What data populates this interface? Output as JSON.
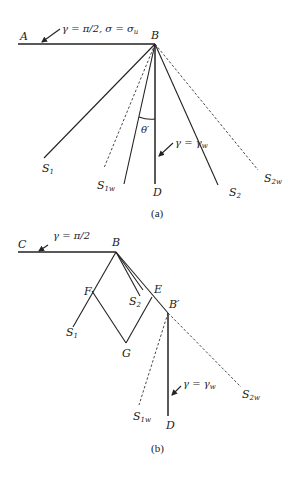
{
  "figure_a": {
    "caption": "(a)",
    "point_A": "A",
    "point_B": "B",
    "point_D": "D",
    "label_S1": "S",
    "label_S1_sub": "1",
    "label_S1w": "S",
    "label_S1w_sub": "1w",
    "label_S2": "S",
    "label_S2_sub": "2",
    "label_S2w": "S",
    "label_S2w_sub": "2w",
    "boundary_condition_top": "γ = π/2, σ = σ",
    "boundary_condition_top_sub": "u",
    "angle_label": "θ′",
    "wall_condition": "γ = γ",
    "wall_condition_sub": "w"
  },
  "figure_b": {
    "caption": "(b)",
    "point_C": "C",
    "point_B": "B",
    "point_F": "F",
    "point_E": "E",
    "point_G": "G",
    "point_Bprime": "B′",
    "point_D": "D",
    "label_S1": "S",
    "label_S1_sub": "1",
    "label_S2": "S",
    "label_S2_sub": "2",
    "label_S1w": "S",
    "label_S1w_sub": "1w",
    "label_S2w": "S",
    "label_S2w_sub": "2w",
    "boundary_condition_top": "γ = π/2",
    "wall_condition": "γ = γ",
    "wall_condition_sub": "w"
  }
}
